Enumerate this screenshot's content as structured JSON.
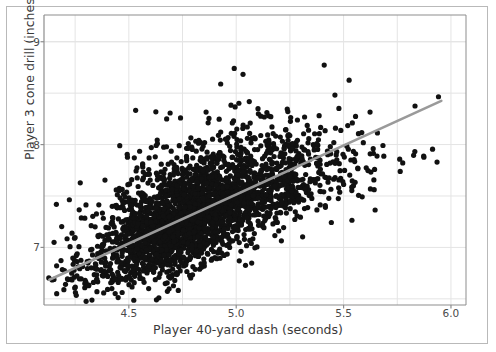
{
  "chart_data": {
    "type": "scatter",
    "title": "",
    "xlabel": "Player 40-yard dash (seconds)",
    "ylabel": "Player 3 cone drill (inches)",
    "xlim": [
      4.105,
      6.07
    ],
    "ylim": [
      6.44,
      9.26
    ],
    "xticks": [
      4.5,
      5.0,
      5.5,
      6.0
    ],
    "xtick_labels": [
      "4.5",
      "5.0",
      "5.5",
      "6.0"
    ],
    "yticks": [
      7,
      8,
      9
    ],
    "ytick_labels": [
      "7",
      "8",
      "9"
    ],
    "x_minor_gridlines": [
      4.25,
      4.75,
      5.25,
      5.75
    ],
    "y_minor_gridlines": [
      6.5,
      7.5,
      8.5,
      9.0
    ],
    "grid": true,
    "legend": "none",
    "point_color": "#111111",
    "point_radius_px": 2.6,
    "n_points": 3000,
    "marker": "circle",
    "regression_line": {
      "name": "linear fit",
      "color": "#9a9a9a",
      "width_px": 2.6,
      "x_start": 4.13,
      "y_start": 6.685,
      "x_end": 5.955,
      "y_end": 8.425,
      "slope": 0.954,
      "intercept": 2.745
    },
    "series": [
      {
        "name": "NFL combine players",
        "description": "Dense positively-correlated cloud of player measurements; core mass spans 4.2-5.6 s and 6.5-8.5 in, with sparse high outliers up to 9.1 in and right-tail points out to 6.05 s.",
        "x_mean": 4.82,
        "y_mean": 7.34,
        "x_sd": 0.245,
        "y_sd": 0.33,
        "correlation": 0.71,
        "x_range": [
          4.12,
          6.05
        ],
        "y_range": [
          6.46,
          9.12
        ]
      }
    ],
    "annotations": [],
    "background_color": "#ffffff",
    "grid_color": "#e4e4e4",
    "axis_color": "#8d8d8d",
    "frame_color": "#b9b9b9",
    "tick_text_color": "#4a4a4a",
    "label_text_color": "#3a3a3a"
  }
}
